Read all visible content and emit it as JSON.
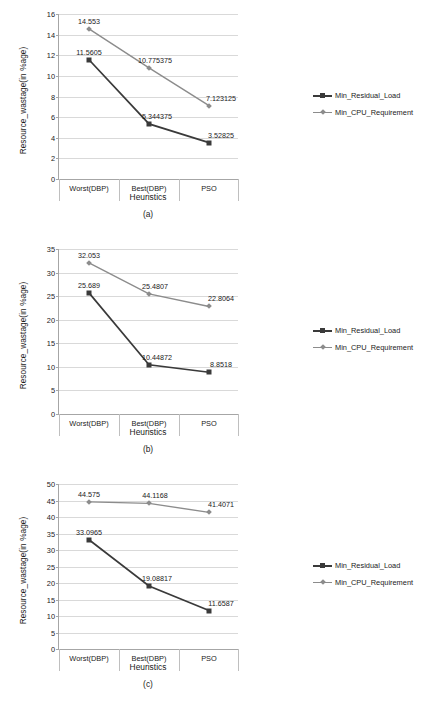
{
  "figures": [
    {
      "caption": "(a)",
      "chart_data": {
        "type": "line",
        "title": "",
        "xlabel": "Heuristics",
        "ylabel": "Resource_wastage(in %age)",
        "categories": [
          "Worst(DBP)",
          "Best(DBP)",
          "PSO"
        ],
        "ylim": [
          0,
          16
        ],
        "ytick_step": 2,
        "yticks": [
          "0",
          "2",
          "4",
          "6",
          "8",
          "10",
          "12",
          "14",
          "16"
        ],
        "grid": true,
        "legend_position": "right",
        "series": [
          {
            "name": "Min_Residual_Load",
            "marker": "square",
            "color": "#3a3a3a",
            "values": [
              11.5605,
              5.344375,
              3.52825
            ],
            "labels": [
              "11.5605",
              "5.344375",
              "3.52825"
            ]
          },
          {
            "name": "Min_CPU_Requirement",
            "marker": "diamond",
            "color": "#8c8c8c",
            "values": [
              14.553,
              10.775375,
              7.123125
            ],
            "labels": [
              "14.553",
              "10.775375",
              "7.123125"
            ]
          }
        ]
      }
    },
    {
      "caption": "(b)",
      "chart_data": {
        "type": "line",
        "title": "",
        "xlabel": "Heuristics",
        "ylabel": "Resource_wastage(in %age)",
        "categories": [
          "Worst(DBP)",
          "Best(DBP)",
          "PSO"
        ],
        "ylim": [
          0,
          35
        ],
        "ytick_step": 5,
        "yticks": [
          "0",
          "5",
          "10",
          "15",
          "20",
          "25",
          "30",
          "35"
        ],
        "grid": true,
        "legend_position": "right",
        "series": [
          {
            "name": "Min_Residual_Load",
            "marker": "square",
            "color": "#3a3a3a",
            "values": [
              25.689,
              10.44872,
              8.8518
            ],
            "labels": [
              "25.689",
              "10.44872",
              "8.8518"
            ]
          },
          {
            "name": "Min_CPU_Requirement",
            "marker": "diamond",
            "color": "#8c8c8c",
            "values": [
              32.053,
              25.4807,
              22.8064
            ],
            "labels": [
              "32.053",
              "25.4807",
              "22.8064"
            ]
          }
        ]
      }
    },
    {
      "caption": "(c)",
      "chart_data": {
        "type": "line",
        "title": "",
        "xlabel": "Heuristics",
        "ylabel": "Resource_wastage(in %age)",
        "categories": [
          "Worst(DBP)",
          "Best(DBP)",
          "PSO"
        ],
        "ylim": [
          0,
          50
        ],
        "ytick_step": 5,
        "yticks": [
          "0",
          "5",
          "10",
          "15",
          "20",
          "25",
          "30",
          "35",
          "40",
          "45",
          "50"
        ],
        "grid": true,
        "legend_position": "right",
        "series": [
          {
            "name": "Min_Residual_Load",
            "marker": "square",
            "color": "#3a3a3a",
            "values": [
              33.0965,
              19.08817,
              11.6587
            ],
            "labels": [
              "33.0965",
              "19.08817",
              "11.6587"
            ]
          },
          {
            "name": "Min_CPU_Requirement",
            "marker": "diamond",
            "color": "#8c8c8c",
            "values": [
              44.575,
              44.1168,
              41.4071
            ],
            "labels": [
              "44.575",
              "44.1168",
              "41.4071"
            ]
          }
        ]
      }
    }
  ],
  "colors": {
    "series_dark": "#3a3a3a",
    "series_gray": "#8c8c8c",
    "gridline": "#d9d9d9",
    "axis": "#a6a6a6"
  }
}
